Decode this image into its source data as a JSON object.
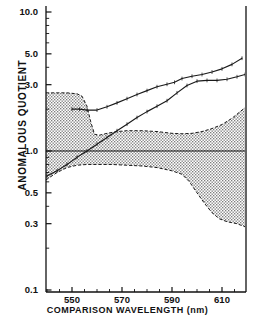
{
  "chart_data": {
    "type": "line",
    "title": "",
    "xlabel": "COMPARISON   WAVELENGTH   (nm)",
    "ylabel": "ANOMALOUS  QUOTIENT",
    "xscale": "linear",
    "yscale": "log",
    "xlim": [
      539.6,
      619.2
    ],
    "ylim": [
      0.1,
      10.0
    ],
    "grid": false,
    "legend": "none",
    "x_ticklabels": [
      "550",
      "570",
      "590",
      "610"
    ],
    "x_tickvalues": [
      550,
      570,
      590,
      610
    ],
    "x_minor_tickvalues": [
      540,
      560,
      580,
      600,
      610
    ],
    "y_ticklabels": [
      "10.0",
      "5.0",
      "3.0",
      "1.0",
      "0.5",
      "0.3",
      "0.1"
    ],
    "y_tickvalues": [
      10.0,
      5.0,
      3.0,
      1.0,
      0.5,
      0.3,
      0.1
    ],
    "reference_line": {
      "name": "unity-reference-line",
      "y": 1.0
    },
    "series": [
      {
        "name": "upper-curve",
        "style": "solid-with-markers",
        "x": [
          550.0,
          553.0,
          556.0,
          560.0,
          564.0,
          568.0,
          572.0,
          576.0,
          580.0,
          584.0,
          588.0,
          591.0,
          594.0,
          598.0,
          602.0,
          606.0,
          610.0,
          614.0,
          618.0
        ],
        "y": [
          2.0,
          2.0,
          1.97,
          1.97,
          2.08,
          2.22,
          2.38,
          2.55,
          2.72,
          2.9,
          3.02,
          3.12,
          3.32,
          3.45,
          3.55,
          3.7,
          3.9,
          4.2,
          4.65
        ]
      },
      {
        "name": "lower-curve",
        "style": "solid-with-markers",
        "x": [
          540.0,
          544.0,
          548.0,
          552.0,
          556.0,
          560.0,
          564.0,
          568.0,
          572.0,
          576.0,
          580.0,
          584.0,
          588.0,
          592.0,
          596.0,
          600.0,
          604.0,
          608.0,
          612.0,
          616.0,
          619.2
        ],
        "y": [
          0.66,
          0.72,
          0.8,
          0.9,
          1.0,
          1.12,
          1.25,
          1.4,
          1.56,
          1.74,
          1.92,
          2.1,
          2.3,
          2.62,
          2.96,
          3.18,
          3.22,
          3.22,
          3.28,
          3.42,
          3.55
        ]
      }
    ],
    "band": {
      "name": "confidence-band",
      "fill": "stipple-hatch",
      "upper": {
        "x": [
          539.6,
          544.0,
          548.0,
          552.0,
          554.0,
          556.0,
          557.5,
          559.0,
          561.0,
          564.0,
          568.0,
          572.0,
          578.0,
          584.0,
          590.0,
          594.0,
          598.0,
          602.0,
          606.0,
          610.0,
          614.0,
          619.2
        ],
        "y": [
          2.62,
          2.62,
          2.62,
          2.58,
          2.48,
          2.1,
          1.62,
          1.32,
          1.3,
          1.34,
          1.38,
          1.4,
          1.4,
          1.38,
          1.34,
          1.33,
          1.34,
          1.38,
          1.45,
          1.55,
          1.72,
          2.05
        ]
      },
      "lower": {
        "x": [
          539.6,
          544.0,
          548.0,
          552.0,
          556.0,
          560.0,
          566.0,
          572.0,
          578.0,
          584.0,
          590.0,
          594.0,
          597.0,
          600.0,
          603.0,
          606.0,
          609.0,
          612.0,
          616.0,
          619.2
        ],
        "y": [
          0.62,
          0.7,
          0.76,
          0.79,
          0.8,
          0.8,
          0.8,
          0.79,
          0.78,
          0.76,
          0.72,
          0.68,
          0.6,
          0.5,
          0.42,
          0.36,
          0.325,
          0.31,
          0.3,
          0.285
        ]
      }
    }
  },
  "axes": {
    "y_label": "ANOMALOUS  QUOTIENT",
    "x_label_main": "COMPARISON    WAVELENGTH",
    "x_label_unit": "(nm)",
    "y_ticks": [
      {
        "label": "10.0",
        "value": 10.0
      },
      {
        "label": "5.0",
        "value": 5.0
      },
      {
        "label": "3.0",
        "value": 3.0
      },
      {
        "label": "1.0",
        "value": 1.0
      },
      {
        "label": "0.5",
        "value": 0.5
      },
      {
        "label": "0.3",
        "value": 0.3
      },
      {
        "label": "0.1",
        "value": 0.1
      }
    ],
    "x_ticks": [
      {
        "label": "550",
        "value": 550
      },
      {
        "label": "570",
        "value": 570
      },
      {
        "label": "590",
        "value": 590
      },
      {
        "label": "610",
        "value": 610
      }
    ]
  }
}
